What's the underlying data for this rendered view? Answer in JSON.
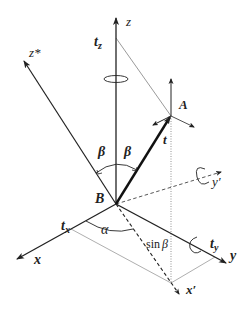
{
  "diagram": {
    "title": "",
    "labels": {
      "z": "z",
      "z_star": "z*",
      "t_z": "t",
      "t_z_sub": "z",
      "A": "A",
      "t": "t",
      "beta_left": "β",
      "beta_right": "β",
      "B": "B",
      "y_prime": "y′",
      "alpha": "α",
      "t_x": "t",
      "t_x_sub": "x",
      "x": "x",
      "sin_text": "sin",
      "sin_beta": "β",
      "t_y": "t",
      "t_y_sub": "y",
      "y": "y",
      "x_prime": "x′"
    },
    "points": {
      "B": [
        116,
        204
      ],
      "A": [
        171,
        116
      ],
      "z_tip": [
        116,
        17
      ],
      "z_star_tip": [
        23,
        60
      ],
      "x_tip": [
        16,
        260
      ],
      "y_tip": [
        227,
        263
      ],
      "x_prime_tip": [
        180,
        295
      ],
      "y_prime_tip": [
        222,
        172
      ]
    },
    "colors": {
      "stroke": "#222222",
      "thin": "#555555",
      "dotted": "#777777"
    }
  }
}
